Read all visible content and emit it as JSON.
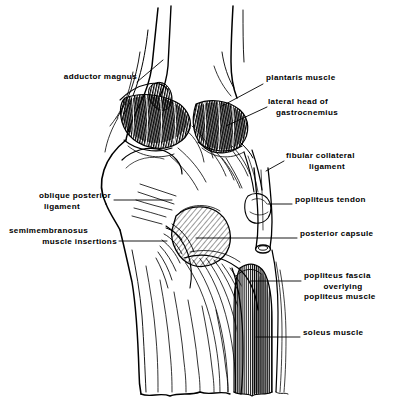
{
  "figure": {
    "view": "posterior",
    "style": "black-and-white line drawing with hatching",
    "ink_color": "#000000",
    "background_color": "#ffffff"
  },
  "labels": [
    {
      "id": "adductor-magnus",
      "text": "adductor magnus",
      "lines": [
        "adductor magnus"
      ],
      "side": "left",
      "text_x": 31,
      "text_y": 77,
      "leader": [
        [
          137,
          82
        ],
        [
          160,
          63
        ]
      ]
    },
    {
      "id": "plantaris-muscle",
      "text": "plantaris muscle",
      "lines": [
        "plantaris muscle"
      ],
      "side": "right",
      "text_x": 266,
      "text_y": 78,
      "leader": [
        [
          262,
          84
        ],
        [
          225,
          104
        ]
      ]
    },
    {
      "id": "lateral-head-of-gastrocnemius",
      "text": "lateral head of gastrocnemius",
      "lines": [
        "lateral head of",
        "gastrocnemius"
      ],
      "side": "right",
      "text_x": 270,
      "text_y": 102,
      "leader": [
        [
          266,
          107
        ],
        [
          228,
          124
        ]
      ]
    },
    {
      "id": "fibular-collateral-ligament",
      "text": "fibular collateral ligament",
      "lines": [
        "fibular collateral",
        "ligament"
      ],
      "side": "right",
      "text_x": 286,
      "text_y": 156,
      "leader": [
        [
          283,
          161
        ],
        [
          268,
          170
        ]
      ]
    },
    {
      "id": "oblique-posterior-ligament",
      "text": "oblique posterior ligament",
      "lines": [
        "oblique posterior",
        "ligament"
      ],
      "side": "left",
      "text_x": 111,
      "text_y": 196,
      "leader": [
        [
          114,
          200
        ],
        [
          168,
          200
        ]
      ]
    },
    {
      "id": "popliteus-tendon",
      "text": "popliteus tendon",
      "lines": [
        "popliteus tendon"
      ],
      "side": "right",
      "text_x": 295,
      "text_y": 200,
      "leader": [
        [
          292,
          204
        ],
        [
          273,
          204
        ]
      ]
    },
    {
      "id": "semimembranosus-muscle-insertions",
      "text": "semimembranosus muscle insertions",
      "lines": [
        "semimembranosus",
        "muscle insertions"
      ],
      "side": "left",
      "text_x": 117,
      "text_y": 231,
      "leader": [
        [
          119,
          241
        ],
        [
          166,
          241
        ]
      ]
    },
    {
      "id": "posterior-capsule",
      "text": "posterior capsule",
      "lines": [
        "posterior capsule"
      ],
      "side": "right",
      "text_x": 300,
      "text_y": 234,
      "leader": [
        [
          297,
          238
        ],
        [
          196,
          238
        ]
      ]
    },
    {
      "id": "popliteus-fascia-overlying-popliteus-muscle",
      "text": "popliteus fascia overlying popliteus muscle",
      "lines": [
        "popliteus fascia",
        "overlying",
        "popliteus muscle"
      ],
      "side": "right",
      "text_x": 304,
      "text_y": 276,
      "leader": [
        [
          301,
          281
        ],
        [
          253,
          281
        ]
      ]
    },
    {
      "id": "soleus-muscle",
      "text": "soleus muscle",
      "lines": [
        "soleus muscle"
      ],
      "side": "right",
      "text_x": 303,
      "text_y": 333,
      "leader": [
        [
          300,
          337
        ],
        [
          258,
          337
        ]
      ]
    }
  ]
}
